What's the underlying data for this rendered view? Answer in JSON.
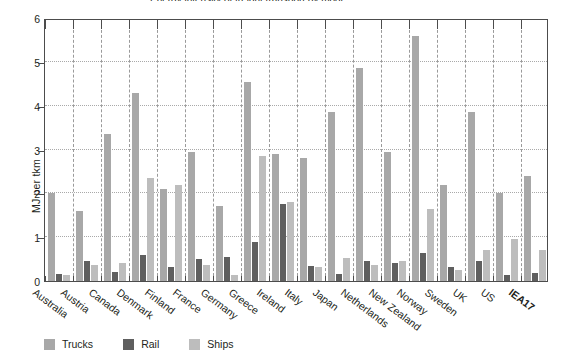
{
  "chart_data": {
    "type": "bar",
    "title": "",
    "title_fragment": "Energy intensity of freight transport by mode",
    "xlabel": "",
    "ylabel": "MJ per tkm",
    "ylim": [
      0,
      6
    ],
    "yticks": [
      0,
      1,
      2,
      3,
      4,
      5,
      6
    ],
    "grid": "horizontal-dotted",
    "legend_position": "bottom-left",
    "categories": [
      "Australia",
      "Austria",
      "Canada",
      "Denmark",
      "Finland",
      "France",
      "Germany",
      "Greece",
      "Ireland",
      "Italy",
      "Japan",
      "Netherlands",
      "New Zealand",
      "Norway",
      "Sweden",
      "UK",
      "US",
      "IEA17"
    ],
    "bold_categories": [
      "IEA17"
    ],
    "series": [
      {
        "name": "Trucks",
        "color": "#a8a8a8",
        "values": [
          2.0,
          1.6,
          3.35,
          4.3,
          2.1,
          2.95,
          1.7,
          4.55,
          2.9,
          2.8,
          3.85,
          4.85,
          2.95,
          5.6,
          2.18,
          3.85,
          2.0,
          2.4
        ]
      },
      {
        "name": "Rail",
        "color": "#5f5f5f",
        "values": [
          0.16,
          0.46,
          0.2,
          0.6,
          0.32,
          0.5,
          0.55,
          0.9,
          1.75,
          0.35,
          0.17,
          0.45,
          0.4,
          0.65,
          0.32,
          0.45,
          0.13,
          0.18
        ]
      },
      {
        "name": "Ships",
        "color": "#bdbdbd",
        "values": [
          0.13,
          0.36,
          0.4,
          2.35,
          2.2,
          0.36,
          0.14,
          2.85,
          1.8,
          0.33,
          0.53,
          0.36,
          0.46,
          1.65,
          0.25,
          0.7,
          0.95,
          0.7
        ]
      }
    ]
  },
  "legend": {
    "items": [
      {
        "label": "Trucks",
        "color": "#a8a8a8"
      },
      {
        "label": "Rail",
        "color": "#5f5f5f"
      },
      {
        "label": "Ships",
        "color": "#bdbdbd"
      }
    ]
  }
}
